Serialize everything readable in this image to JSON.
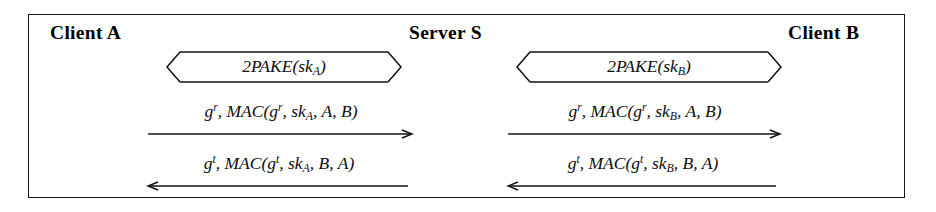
{
  "diagram": {
    "type": "protocol-message-sequence-diagram",
    "colors": {
      "ink": "#000000",
      "border": "#1a1a1a",
      "background": "#ffffff"
    },
    "parties": [
      {
        "id": "client-a",
        "label": "Client A"
      },
      {
        "id": "server-s",
        "label": "Server S"
      },
      {
        "id": "client-b",
        "label": "Client B"
      }
    ],
    "messages": [
      {
        "id": "pake-a",
        "arrow": "bidirectional-chevron",
        "from": "client-a",
        "to": "server-s",
        "label_plain": "2PAKE(skA)",
        "label_html": "2<i>PAKE</i>(<i>sk<sub>A</sub></i>)"
      },
      {
        "id": "pake-b",
        "arrow": "bidirectional-chevron",
        "from": "server-s",
        "to": "client-b",
        "label_plain": "2PAKE(skB)",
        "label_html": "2<i>PAKE</i>(<i>sk<sub>B</sub></i>)"
      },
      {
        "id": "gr-mac-a",
        "arrow": "right",
        "from": "client-a",
        "to": "server-s",
        "label_plain": "g^r, MAC(g^r, skA, A, B)",
        "label_html": "<i>g<sup>r</sup></i>, <i>MAC</i>(<i>g<sup>r</sup></i>, <i>sk<sub>A</sub></i>, <i>A</i>, <i>B</i>)"
      },
      {
        "id": "gr-mac-b",
        "arrow": "right",
        "from": "server-s",
        "to": "client-b",
        "label_plain": "g^r, MAC(g^r, skB, A, B)",
        "label_html": "<i>g<sup>r</sup></i>, <i>MAC</i>(<i>g<sup>r</sup></i>, <i>sk<sub>B</sub></i>, <i>A</i>, <i>B</i>)"
      },
      {
        "id": "gt-mac-a",
        "arrow": "left",
        "from": "server-s",
        "to": "client-a",
        "label_plain": "g^t, MAC(g^t, skA, B, A)",
        "label_html": "<i>g<sup>t</sup></i>, <i>MAC</i>(<i>g<sup>t</sup></i>, <i>sk<sub>A</sub></i>, <i>B</i>, <i>A</i>)"
      },
      {
        "id": "gt-mac-b",
        "arrow": "left",
        "from": "client-b",
        "to": "server-s",
        "label_plain": "g^t, MAC(g^t, skB, B, A)",
        "label_html": "<i>g<sup>t</sup></i>, <i>MAC</i>(<i>g<sup>t</sup></i>, <i>sk<sub>B</sub></i>, <i>B</i>, <i>A</i>)"
      }
    ]
  }
}
